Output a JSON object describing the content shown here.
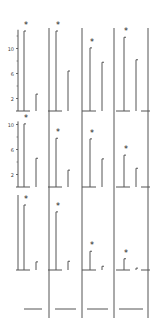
{
  "chart_data": {
    "type": "bar",
    "title": "",
    "xlabel": "",
    "ylabel": "",
    "layout": {
      "rows": 3,
      "columns": 4,
      "grid": false,
      "legend": "none"
    },
    "significance_marker": "*",
    "panels": [
      {
        "row": 1,
        "yticks": [
          2,
          6,
          10
        ],
        "ylim": [
          0,
          13
        ],
        "columns": [
          {
            "col": 1,
            "values": [
              12.8,
              2.7
            ],
            "significant": true
          },
          {
            "col": 2,
            "values": [
              12.8,
              6.4
            ],
            "significant": true
          },
          {
            "col": 3,
            "values": [
              10.1,
              7.8
            ],
            "significant": true
          },
          {
            "col": 4,
            "values": [
              11.8,
              8.2
            ],
            "significant": true
          }
        ]
      },
      {
        "row": 2,
        "yticks": [
          2,
          6,
          10
        ],
        "ylim": [
          0,
          10.5
        ],
        "columns": [
          {
            "col": 1,
            "values": [
              10.1,
              4.6
            ],
            "significant": true
          },
          {
            "col": 2,
            "values": [
              7.8,
              2.7
            ],
            "significant": true
          },
          {
            "col": 3,
            "values": [
              7.7,
              4.5
            ],
            "significant": true
          },
          {
            "col": 4,
            "values": [
              5.1,
              3.0
            ],
            "significant": true
          }
        ]
      },
      {
        "row": 3,
        "yticks": [],
        "ylim": [
          0,
          12
        ],
        "columns": [
          {
            "col": 1,
            "values": [
              10.4,
              1.3
            ],
            "significant": true
          },
          {
            "col": 2,
            "values": [
              9.3,
              1.4
            ],
            "significant": true
          },
          {
            "col": 3,
            "values": [
              3.0,
              0.6
            ],
            "significant": true
          },
          {
            "col": 4,
            "values": [
              1.8,
              0.3
            ],
            "significant": true
          }
        ]
      }
    ]
  }
}
